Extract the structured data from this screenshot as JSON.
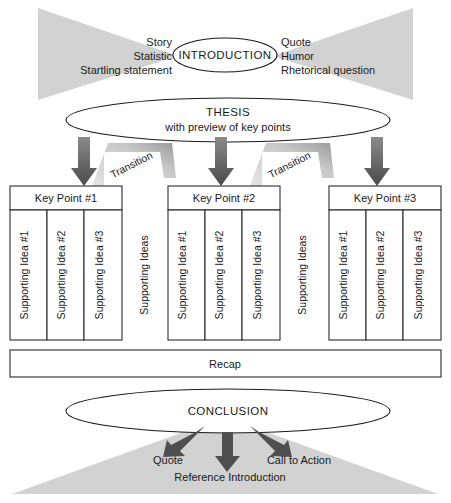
{
  "diagram": {
    "colors": {
      "triangle_gray": "#d2d2d2",
      "arrow_dark": "#555555",
      "arrow_light": "#d8d8d8",
      "stroke": "#1a1a1a",
      "background": "#ffffff"
    },
    "introduction": {
      "label": "INTRODUCTION",
      "left_options": [
        "Story",
        "Statistic",
        "Startling statement"
      ],
      "right_options": [
        "Quote",
        "Humor",
        "Rhetorical question"
      ]
    },
    "thesis": {
      "line1": "THESIS",
      "line2": "with preview of key points"
    },
    "transitions": [
      {
        "label": "Transition"
      },
      {
        "label": "Transition"
      }
    ],
    "between_labels": [
      {
        "label": "Supporting Ideas"
      },
      {
        "label": "Supporting Ideas"
      }
    ],
    "key_points": [
      {
        "header": "Key Point #1",
        "supporting_ideas": [
          "Supporting Idea #1",
          "Supporting Idea #2",
          "Supporting Idea #3"
        ]
      },
      {
        "header": "Key Point #2",
        "supporting_ideas": [
          "Supporting Idea #1",
          "Supporting Idea #2",
          "Supporting Idea #3"
        ]
      },
      {
        "header": "Key Point #3",
        "supporting_ideas": [
          "Supporting Idea #1",
          "Supporting Idea #2",
          "Supporting Idea #3"
        ]
      }
    ],
    "recap": {
      "label": "Recap"
    },
    "conclusion": {
      "label": "CONCLUSION",
      "outputs": [
        "Quote",
        "Reference Introduction",
        "Call to Action"
      ]
    }
  }
}
